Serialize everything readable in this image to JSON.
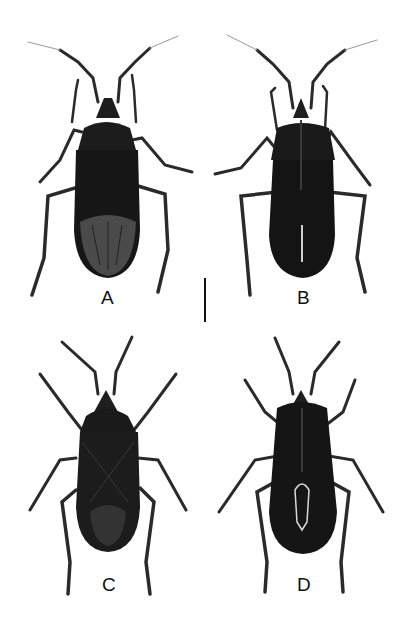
{
  "figure": {
    "panels": [
      {
        "id": "A",
        "label": "A",
        "view": "dorsal",
        "wing_state": "wings closed, membrane visible"
      },
      {
        "id": "B",
        "label": "B",
        "view": "ventral"
      },
      {
        "id": "C",
        "label": "C",
        "view": "dorsal"
      },
      {
        "id": "D",
        "label": "D",
        "view": "ventral"
      }
    ],
    "scale_bar": {
      "orientation": "vertical",
      "label": ""
    },
    "colors": {
      "background": "#ffffff",
      "specimen": "#1a1a1a",
      "legs": "#2a2a2a",
      "text": "#111111"
    }
  }
}
